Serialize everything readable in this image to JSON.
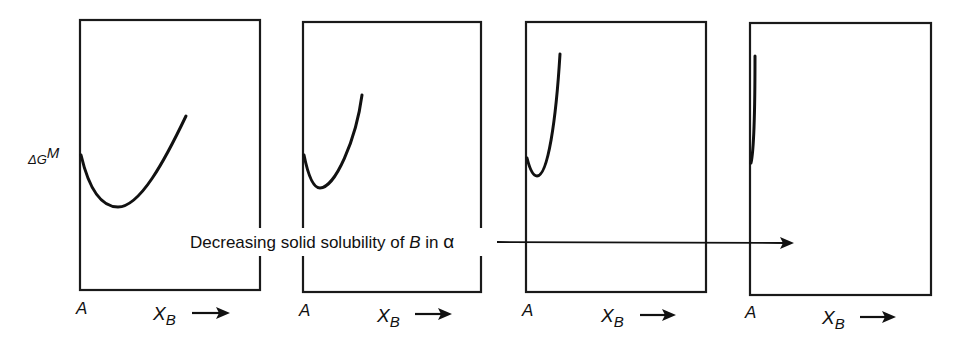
{
  "figure": {
    "y_label": {
      "symbol": "ΔG",
      "superscript": "M"
    },
    "banner": {
      "text_prefix": "Decreasing solid solubility of ",
      "text_italic": "B",
      "text_middle": " in ",
      "text_greek": "α"
    },
    "panels": [
      {
        "origin_label": "A",
        "x_axis": {
          "symbol": "X",
          "subscript": "B"
        },
        "curve": "wide-minimum"
      },
      {
        "origin_label": "A",
        "x_axis": {
          "symbol": "X",
          "subscript": "B"
        },
        "curve": "narrower-minimum"
      },
      {
        "origin_label": "A",
        "x_axis": {
          "symbol": "X",
          "subscript": "B"
        },
        "curve": "steep-narrow-minimum"
      },
      {
        "origin_label": "A",
        "x_axis": {
          "symbol": "X",
          "subscript": "B"
        },
        "curve": "near-vertical"
      }
    ],
    "colors": {
      "ink": "#111111",
      "background": "#ffffff"
    }
  }
}
